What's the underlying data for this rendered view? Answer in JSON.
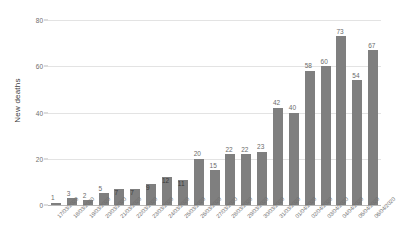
{
  "chart_data": {
    "type": "bar",
    "title": "",
    "xlabel": "",
    "ylabel": "New deaths",
    "ylim": [
      0,
      80
    ],
    "yticks": [
      0,
      20,
      40,
      60,
      80
    ],
    "grid": true,
    "legend": false,
    "bar_color": "#7f7f7f",
    "categories": [
      "17/03/2020",
      "18/03/2020",
      "19/03/2020",
      "20/03/2020",
      "21/03/2020",
      "22/03/2020",
      "23/03/2020",
      "24/03/2020",
      "25/03/2020",
      "26/03/2020",
      "27/03/2020",
      "28/03/2020",
      "29/03/2020",
      "30/03/2020",
      "31/03/2020",
      "01/04/2020",
      "02/04/2020",
      "03/04/2020",
      "04/04/2020",
      "05/04/2020",
      "06/04/2020"
    ],
    "values": [
      1,
      3,
      2,
      5,
      7,
      7,
      9,
      12,
      11,
      20,
      15,
      22,
      22,
      23,
      42,
      40,
      58,
      60,
      73,
      54,
      67
    ],
    "data_labels": [
      "1",
      "3",
      "2",
      "5",
      "7",
      "7",
      "9",
      "12",
      "11",
      "20",
      "15",
      "22",
      "22",
      "23",
      "42",
      "40",
      "58",
      "60",
      "73",
      "54",
      "67"
    ]
  }
}
